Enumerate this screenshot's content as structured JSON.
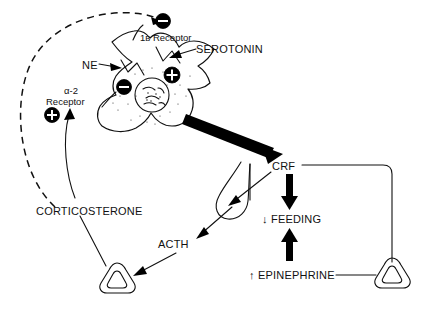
{
  "diagram": {
    "background_color": "#ffffff",
    "ink_color": "#111111",
    "labels": {
      "receptor_1b": "1ʙ Receptor",
      "serotonin": "SEROTONIN",
      "ne": "NE",
      "alpha2_line1": "α-2",
      "alpha2_line2": "Receptor",
      "corticosterone": "CORTICOSTERONE",
      "acth": "ACTH",
      "crf": "CRF",
      "feeding": "↓ FEEDING",
      "epinephrine": "↑ EPINEPHRINE"
    },
    "signs": {
      "minus_top": "−",
      "minus_ne": "−",
      "plus_serotonin": "+",
      "plus_alpha2": "+"
    },
    "nodes": [
      {
        "name": "receptor-1b",
        "label": "1ʙ Receptor",
        "sign": "minus"
      },
      {
        "name": "serotonin",
        "label": "SEROTONIN",
        "sign": "plus"
      },
      {
        "name": "ne",
        "label": "NE",
        "sign": "minus"
      },
      {
        "name": "alpha-2-receptor",
        "label": "α-2 Receptor",
        "sign": "plus"
      },
      {
        "name": "neuron",
        "label": "",
        "sign": ""
      },
      {
        "name": "crf",
        "label": "CRF",
        "sign": ""
      },
      {
        "name": "pituitary",
        "label": "",
        "sign": ""
      },
      {
        "name": "acth",
        "label": "ACTH",
        "sign": ""
      },
      {
        "name": "adrenal-left",
        "label": "",
        "sign": ""
      },
      {
        "name": "adrenal-right",
        "label": "",
        "sign": ""
      },
      {
        "name": "corticosterone",
        "label": "CORTICOSTERONE",
        "sign": ""
      },
      {
        "name": "feeding",
        "label": "↓ FEEDING",
        "sign": ""
      },
      {
        "name": "epinephrine",
        "label": "↑ EPINEPHRINE",
        "sign": ""
      }
    ],
    "connections": [
      {
        "from": "corticosterone",
        "to": "receptor-1b",
        "style": "dashed",
        "weight": "medium"
      },
      {
        "from": "corticosterone",
        "to": "alpha-2-receptor",
        "style": "solid",
        "weight": "thin"
      },
      {
        "from": "neuron",
        "to": "crf",
        "style": "solid",
        "weight": "thick"
      },
      {
        "from": "crf",
        "to": "pituitary",
        "style": "solid",
        "weight": "thin"
      },
      {
        "from": "pituitary",
        "to": "acth",
        "style": "solid",
        "weight": "thin"
      },
      {
        "from": "acth",
        "to": "adrenal-left",
        "style": "solid",
        "weight": "thin"
      },
      {
        "from": "adrenal-left",
        "to": "corticosterone",
        "style": "solid",
        "weight": "thin"
      },
      {
        "from": "crf",
        "to": "feeding",
        "style": "solid",
        "weight": "thick"
      },
      {
        "from": "epinephrine",
        "to": "feeding",
        "style": "solid",
        "weight": "thick"
      },
      {
        "from": "crf",
        "to": "adrenal-right",
        "style": "solid",
        "weight": "thin"
      },
      {
        "from": "adrenal-right",
        "to": "epinephrine",
        "style": "solid",
        "weight": "thin"
      }
    ]
  }
}
